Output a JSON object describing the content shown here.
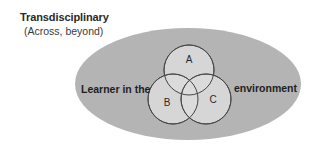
{
  "header": {
    "title": "Transdisciplinary",
    "subtitle": "(Across, beyond)"
  },
  "diagram": {
    "type": "venn-in-ellipse",
    "outer_label_left": "Learner in the",
    "outer_label_right": "environment",
    "circles": [
      {
        "label": "A"
      },
      {
        "label": "B"
      },
      {
        "label": "C"
      }
    ],
    "colors": {
      "ellipse_fill": "#b4b4b4",
      "circle_fill": "#dcdcdc",
      "circle_stroke": "#4a4a4a",
      "text": "#1e1e1e"
    }
  }
}
